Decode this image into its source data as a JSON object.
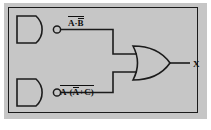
{
  "figure": {
    "background_color": "#c6c6c6",
    "page_color": "#ffffff",
    "line_color": "#1b1b1b",
    "text_color": "#101010"
  },
  "frame": {
    "border_color": "#1b1b1b",
    "fill": "none"
  },
  "gates": [
    {
      "id": "nand-top",
      "type": "NAND",
      "label": "NAND gate (top)",
      "has_bubble": true,
      "output_signal": "A·B (inverted)"
    },
    {
      "id": "nand-bottom",
      "type": "NAND",
      "label": "NAND gate (bottom)",
      "has_bubble": true,
      "output_signal": "A·(A̅+C) (inverted)"
    },
    {
      "id": "or-gate",
      "type": "OR",
      "label": "OR gate",
      "has_bubble": false,
      "output_signal": "X"
    }
  ],
  "labels": {
    "top_expression": {
      "overbar_whole": true,
      "left_term": "A",
      "operator": "·",
      "right_term": "B",
      "right_term_overbar": true,
      "plain_text": "A·B̅ (whole expression overbarred)"
    },
    "bottom_expression": {
      "overbar_whole": true,
      "left_term": "A",
      "operator": "·",
      "group_open": "(",
      "group_first": "A",
      "group_first_overbar": true,
      "group_operator": "+",
      "group_second": "C",
      "group_close": ")",
      "plain_text": "A·(A̅+C) (whole expression overbarred)"
    },
    "output": {
      "text": "X"
    }
  },
  "wires": [
    {
      "name": "top-nand-to-or",
      "from": "nand-top output",
      "to": "or-gate input 1"
    },
    {
      "name": "bottom-nand-to-or",
      "from": "nand-bottom output",
      "to": "or-gate input 2"
    },
    {
      "name": "or-to-output",
      "from": "or-gate output",
      "to": "X terminal"
    }
  ]
}
